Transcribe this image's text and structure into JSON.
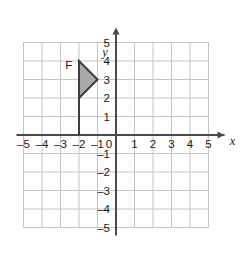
{
  "figure": {
    "type": "coordinate-plane",
    "background_color": "#ffffff",
    "grid": {
      "color": "#c4c4c4",
      "x_min": -5,
      "x_max": 5,
      "y_min": -5,
      "y_max": 5,
      "step": 1,
      "visible": true
    },
    "axes": {
      "color": "#4a4a4a",
      "x_label": "x",
      "y_label": "y",
      "x_arrow": "right",
      "y_arrow": "up",
      "origin_label": "0"
    },
    "x_ticks": [
      "-5",
      "-4",
      "-3",
      "-2",
      "-1",
      "0",
      "1",
      "2",
      "3",
      "4",
      "5"
    ],
    "y_ticks": [
      "5",
      "4",
      "3",
      "2",
      "1",
      "-1",
      "-2",
      "-3",
      "-4",
      "-5"
    ],
    "shapes": [
      {
        "name": "flag-F",
        "label": "F",
        "label_position": {
          "x": -2.55,
          "y": 3.55
        },
        "fill_color": "#a9a9a9",
        "stroke_color": "#3c3c3c",
        "pole": {
          "from": {
            "x": -2,
            "y": 0
          },
          "to": {
            "x": -2,
            "y": 4
          }
        },
        "triangle_vertices": [
          {
            "x": -2,
            "y": 4
          },
          {
            "x": -1,
            "y": 3
          },
          {
            "x": -2,
            "y": 2
          }
        ]
      }
    ]
  }
}
